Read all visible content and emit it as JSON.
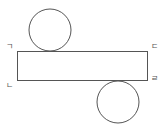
{
  "diagram": {
    "type": "cylinder-net",
    "stroke_color": "#555555",
    "rectangle": {
      "x": 17,
      "y": 51,
      "width": 131,
      "height": 30
    },
    "top_circle": {
      "cx": 50,
      "cy": 30,
      "r": 21
    },
    "bottom_circle": {
      "cx": 118,
      "cy": 102,
      "r": 21
    },
    "labels": {
      "top_left": "ㄱ",
      "bottom_left": "ㄴ",
      "top_right": "ㄷ",
      "bottom_right": "ㄹ"
    }
  }
}
